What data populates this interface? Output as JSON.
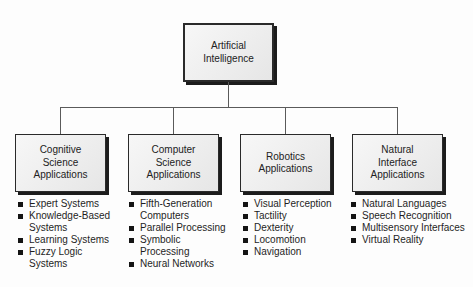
{
  "diagram": {
    "root": {
      "label": "Artificial\nIntelligence"
    },
    "branches": [
      {
        "label": "Cognitive\nScience\nApplications",
        "items": [
          "Expert Systems",
          "Knowledge-Based\nSystems",
          "Learning Systems",
          "Fuzzy Logic\nSystems"
        ]
      },
      {
        "label": "Computer\nScience\nApplications",
        "items": [
          "Fifth-Generation\nComputers",
          "Parallel Processing",
          "Symbolic\nProcessing",
          "Neural Networks"
        ]
      },
      {
        "label": "Robotics\nApplications",
        "items": [
          "Visual Perception",
          "Tactility",
          "Dexterity",
          "Locomotion",
          "Navigation"
        ]
      },
      {
        "label": "Natural\nInterface\nApplications",
        "items": [
          "Natural Languages",
          "Speech Recognition",
          "Multisensory Interfaces",
          "Virtual Reality"
        ]
      }
    ],
    "colors": {
      "box_fill": "#ececec",
      "box_border": "#2a2a2a",
      "box_shadow": "#1c1c1c",
      "connector_line": "#5a5a5a",
      "text": "#1f1f1f",
      "background": "#fdfdfd"
    }
  }
}
